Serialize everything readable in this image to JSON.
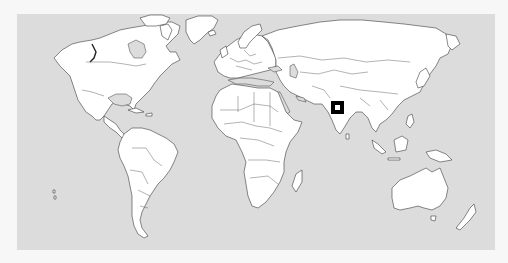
{
  "map": {
    "type": "world-political-outline",
    "projection": "cylindrical",
    "colors": {
      "ocean": "#dcdcdc",
      "land": "#ffffff",
      "border": "#3a3a3a",
      "page_background": "#f7f7f7",
      "marker_outline": "#000000",
      "marker_fill": "#ffffff"
    },
    "frame": {
      "x": 17,
      "y": 14,
      "width": 478,
      "height": 236
    },
    "marker": {
      "shape": "square",
      "region": "western India",
      "x": 331,
      "y": 101,
      "size": 13,
      "inner_size": 5
    }
  }
}
